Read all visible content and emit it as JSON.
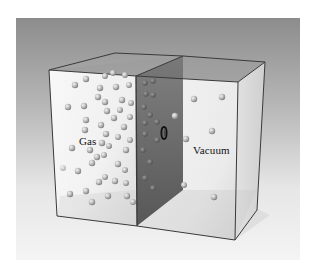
{
  "figure": {
    "labels": {
      "gas": "Gas",
      "vacuum": "Vacuum"
    },
    "chambers": [
      {
        "name": "gas-chamber",
        "content": "gas molecules"
      },
      {
        "name": "vacuum-chamber",
        "content": "vacuum"
      }
    ],
    "partition": {
      "name": "partition-wall",
      "has_valve": true
    },
    "colors": {
      "background_top": "#8a8a8a",
      "background_bottom": "#f2f2f2",
      "partition": "#5a5a5a",
      "edge": "#3a3a3a",
      "molecule": "#b8b8b8"
    }
  }
}
